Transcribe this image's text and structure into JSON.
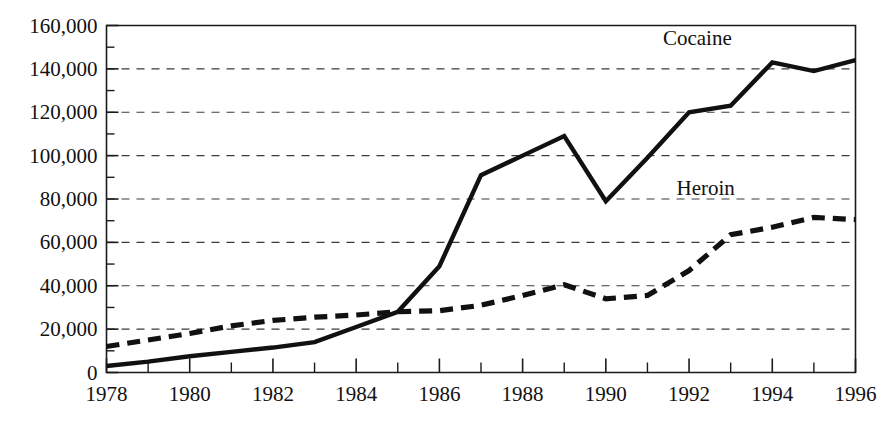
{
  "chart_data": {
    "type": "line",
    "title": "",
    "subtitle": "",
    "xlabel": "",
    "ylabel": "",
    "xlim": [
      1978,
      1996
    ],
    "ylim": [
      0,
      160000
    ],
    "grid": true,
    "grid_axis": "y",
    "legend_position": "inline-right",
    "x": [
      1978,
      1979,
      1980,
      1981,
      1982,
      1983,
      1984,
      1985,
      1986,
      1987,
      1988,
      1989,
      1990,
      1991,
      1992,
      1993,
      1994,
      1995,
      1996
    ],
    "series": [
      {
        "name": "Cocaine",
        "style": "solid",
        "color": "#111111",
        "label_x": 1992.2,
        "label_y": 151000,
        "values": [
          3000,
          5000,
          7500,
          9500,
          11500,
          14000,
          21000,
          28000,
          49000,
          91000,
          100000,
          109000,
          79000,
          99000,
          120000,
          123000,
          143000,
          139000,
          144000
        ]
      },
      {
        "name": "Heroin",
        "style": "dashed",
        "color": "#111111",
        "label_x": 1992.4,
        "label_y": 82000,
        "values": [
          12000,
          15000,
          18000,
          21500,
          24000,
          25500,
          26500,
          28000,
          28500,
          31000,
          35500,
          40500,
          34000,
          35500,
          47000,
          63500,
          67000,
          71500,
          70500
        ]
      }
    ],
    "y_axis": {
      "major_ticks": [
        0,
        20000,
        40000,
        60000,
        80000,
        100000,
        120000,
        140000,
        160000
      ],
      "major_tick_labels": [
        "0",
        "20,000",
        "40,000",
        "60,000",
        "80,000",
        "100,000",
        "120,000",
        "140,000",
        "160,000"
      ],
      "minor_ticks": [
        10000,
        30000,
        50000,
        70000,
        90000,
        110000,
        130000,
        150000
      ]
    },
    "x_axis": {
      "major_ticks": [
        1978,
        1980,
        1982,
        1984,
        1986,
        1988,
        1990,
        1992,
        1994,
        1996
      ],
      "major_tick_labels": [
        "1978",
        "1980",
        "1982",
        "1984",
        "1986",
        "1988",
        "1990",
        "1992",
        "1994",
        "1996"
      ],
      "minor_ticks": [
        1979,
        1981,
        1983,
        1985,
        1987,
        1989,
        1991,
        1993,
        1995
      ]
    }
  },
  "labels": {
    "cocaine": "Cocaine",
    "heroin": "Heroin"
  }
}
